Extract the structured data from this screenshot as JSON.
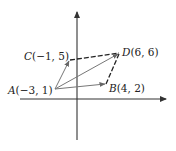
{
  "diagram": {
    "type": "vector-parallelogram",
    "axes": {
      "x_axis": true,
      "y_axis": true,
      "arrows": true,
      "ticks": false
    },
    "points": [
      {
        "name": "A",
        "coords": "(−3, 1)",
        "label": "A(−3, 1)",
        "letter": "A",
        "rest": "(−3, 1)",
        "x": -3,
        "y": 1
      },
      {
        "name": "B",
        "coords": "(4, 2)",
        "label": "B(4, 2)",
        "letter": "B",
        "rest": "(4, 2)",
        "x": 4,
        "y": 2
      },
      {
        "name": "C",
        "coords": "(−1, 5)",
        "label": "C(−1, 5)",
        "letter": "C",
        "rest": "(−1, 5)",
        "x": -1,
        "y": 5
      },
      {
        "name": "D",
        "coords": "(6, 6)",
        "label": "D(6, 6)",
        "letter": "D",
        "rest": "(6, 6)",
        "x": 6,
        "y": 6
      }
    ],
    "vectors": [
      {
        "from": "A",
        "to": "B",
        "style": "solid",
        "arrow": true
      },
      {
        "from": "A",
        "to": "C",
        "style": "solid",
        "arrow": true
      },
      {
        "from": "A",
        "to": "D",
        "style": "solid",
        "arrow": true
      }
    ],
    "dashed_segments": [
      {
        "from": "C",
        "to": "D"
      },
      {
        "from": "B",
        "to": "D"
      }
    ],
    "colors": {
      "vector": "#777777",
      "dashed": "#222222",
      "axis": "#333333"
    }
  }
}
